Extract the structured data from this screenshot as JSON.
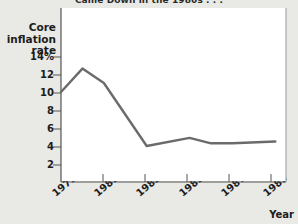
{
  "chart_data": {
    "type": "line",
    "title": "Came Down in the 1980s . . .",
    "ylabel": "Core inflation rate",
    "xlabel": "Year",
    "ytick_labels": [
      "14%",
      "12",
      "10",
      "8",
      "6",
      "4",
      "2"
    ],
    "ytick_values": [
      14,
      12,
      10,
      8,
      6,
      4,
      2
    ],
    "xtick_labels": [
      "1979",
      "1981",
      "1983",
      "1985",
      "1987",
      "1989"
    ],
    "xtick_values": [
      1979,
      1981,
      1983,
      1985,
      1987,
      1989
    ],
    "xlim": [
      1979,
      1989.5
    ],
    "ylim": [
      0,
      14.5
    ],
    "grid": false,
    "legend": false,
    "line_color": "#6b6b6b",
    "series": [
      {
        "name": "Core inflation rate",
        "x": [
          1979,
          1980,
          1981,
          1983,
          1985,
          1986,
          1987,
          1989
        ],
        "values": [
          10.0,
          12.6,
          11.0,
          4.0,
          4.9,
          4.3,
          4.3,
          4.5
        ]
      }
    ]
  },
  "colors": {
    "background": "#e9e9e6",
    "plot_background": "#ffffff",
    "line": "#6b6b6b",
    "axis": "#555555",
    "text": "#1c1c1c"
  }
}
